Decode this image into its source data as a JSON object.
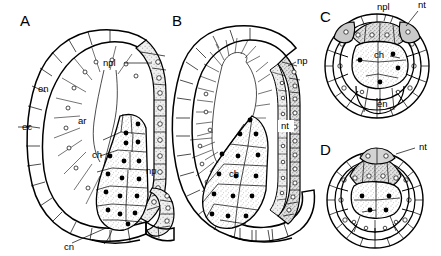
{
  "figure": {
    "type": "scientific-line-drawing",
    "background_color": "#ffffff",
    "ink_color": "#000000",
    "panel_count": 4
  },
  "panels": [
    {
      "id": "A",
      "letter": "A",
      "letter_pos": {
        "x": 20,
        "y": 26
      },
      "view": "sagittal-section",
      "labels": [
        {
          "key": "npl",
          "text": "npl",
          "x": 103,
          "y": 66,
          "leader": true
        },
        {
          "key": "en",
          "text": "en",
          "x": 38,
          "y": 92,
          "leader": false
        },
        {
          "key": "ec",
          "text": "ec",
          "x": 22,
          "y": 130,
          "leader": true
        },
        {
          "key": "ar",
          "text": "ar",
          "x": 78,
          "y": 124,
          "leader": false
        },
        {
          "key": "ch",
          "text": "ch",
          "x": 92,
          "y": 158,
          "leader": false
        },
        {
          "key": "np",
          "text": "np",
          "x": 146,
          "y": 174,
          "leader": false
        },
        {
          "key": "cn",
          "text": "cn",
          "x": 64,
          "y": 250,
          "leader": true
        }
      ]
    },
    {
      "id": "B",
      "letter": "B",
      "letter_pos": {
        "x": 172,
        "y": 26
      },
      "view": "sagittal-section",
      "labels": [
        {
          "key": "np",
          "text": "np",
          "x": 297,
          "y": 64,
          "leader": false
        },
        {
          "key": "nt",
          "text": "nt",
          "x": 281,
          "y": 129,
          "leader": false
        },
        {
          "key": "ch",
          "text": "ch",
          "x": 229,
          "y": 177,
          "leader": false
        }
      ]
    },
    {
      "id": "C",
      "letter": "C",
      "letter_pos": {
        "x": 320,
        "y": 22
      },
      "view": "transverse-section",
      "labels": [
        {
          "key": "npl",
          "text": "npl",
          "x": 377,
          "y": 10,
          "leader": true
        },
        {
          "key": "nt",
          "text": "nt",
          "x": 418,
          "y": 8,
          "leader": true
        },
        {
          "key": "ch",
          "text": "ch",
          "x": 374,
          "y": 58,
          "leader": true
        },
        {
          "key": "en",
          "text": "en",
          "x": 377,
          "y": 107,
          "leader": true
        }
      ]
    },
    {
      "id": "D",
      "letter": "D",
      "letter_pos": {
        "x": 320,
        "y": 155
      },
      "view": "transverse-section",
      "labels": [
        {
          "key": "nt",
          "text": "nt",
          "x": 419,
          "y": 150,
          "leader": true
        }
      ]
    }
  ],
  "legend_keys": [
    {
      "abbr": "npl",
      "meaning": "neural plate"
    },
    {
      "abbr": "np",
      "meaning": "neuropore"
    },
    {
      "abbr": "nt",
      "meaning": "neural tube"
    },
    {
      "abbr": "ch",
      "meaning": "chordamesoderm / notochord"
    },
    {
      "abbr": "en",
      "meaning": "endoderm"
    },
    {
      "abbr": "ec",
      "meaning": "ectoderm"
    },
    {
      "abbr": "ar",
      "meaning": "archenteron"
    },
    {
      "abbr": "cn",
      "meaning": "canal / blastopore"
    }
  ],
  "colors": {
    "ink": "#000000",
    "paper": "#ffffff",
    "tissue_light_fill": "#f2f2f2",
    "tissue_mid_fill": "#d8d8d8",
    "stipple_fill": "#ebebeb"
  }
}
